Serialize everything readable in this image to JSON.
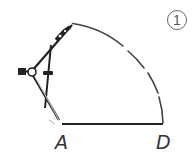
{
  "figure": {
    "step_label": "1",
    "points": [
      {
        "name": "A",
        "label": "A"
      },
      {
        "name": "D",
        "label": "D"
      }
    ],
    "colors": {
      "line": "#222222",
      "arc": "#444444",
      "background": "#ffffff"
    }
  }
}
